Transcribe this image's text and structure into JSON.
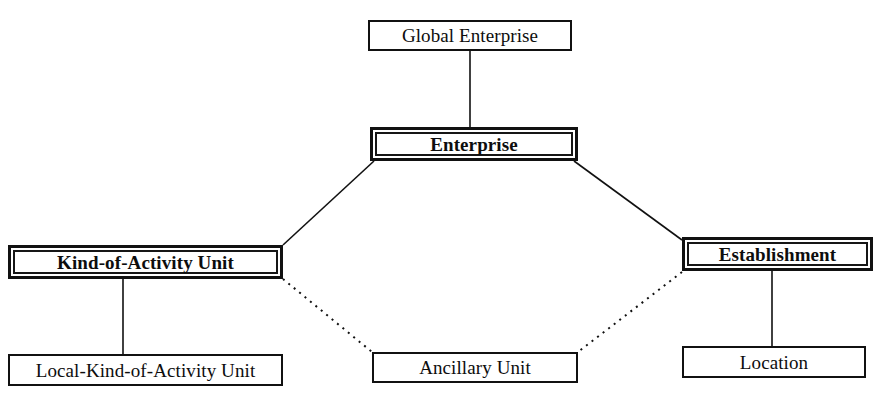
{
  "diagram": {
    "type": "hierarchy-tree",
    "canvas": {
      "width": 878,
      "height": 400,
      "background": "#ffffff"
    },
    "stroke_color": "#111111",
    "nodes": [
      {
        "id": "global-enterprise",
        "label": "Global Enterprise",
        "border": "single",
        "level": 0,
        "box": {
          "x": 368,
          "y": 20,
          "w": 204,
          "h": 31
        }
      },
      {
        "id": "enterprise",
        "label": "Enterprise",
        "border": "double",
        "level": 1,
        "box": {
          "x": 370,
          "y": 127,
          "w": 208,
          "h": 34
        }
      },
      {
        "id": "kind-of-activity-unit",
        "label": "Kind-of-Activity Unit",
        "border": "double",
        "level": 2,
        "box": {
          "x": 8,
          "y": 245,
          "w": 275,
          "h": 34
        }
      },
      {
        "id": "establishment",
        "label": "Establishment",
        "border": "double",
        "level": 2,
        "box": {
          "x": 682,
          "y": 237,
          "w": 191,
          "h": 34
        }
      },
      {
        "id": "local-kind-of-activity-unit",
        "label": "Local-Kind-of-Activity Unit",
        "border": "single",
        "level": 3,
        "box": {
          "x": 8,
          "y": 354,
          "w": 275,
          "h": 32
        }
      },
      {
        "id": "ancillary-unit",
        "label": "Ancillary Unit",
        "border": "single",
        "level": 3,
        "box": {
          "x": 372,
          "y": 352,
          "w": 206,
          "h": 31
        }
      },
      {
        "id": "location",
        "label": "Location",
        "border": "single",
        "level": 3,
        "box": {
          "x": 682,
          "y": 346,
          "w": 184,
          "h": 32
        }
      }
    ],
    "edges": [
      {
        "id": "edge-global-enterprise-to-enterprise",
        "from": "global-enterprise",
        "to": "enterprise",
        "style": "solid",
        "x1": 470,
        "y1": 51,
        "x2": 470,
        "y2": 127
      },
      {
        "id": "edge-enterprise-to-kind-of-activity-unit",
        "from": "enterprise",
        "to": "kind-of-activity-unit",
        "style": "solid",
        "x1": 374,
        "y1": 161,
        "x2": 283,
        "y2": 245
      },
      {
        "id": "edge-enterprise-to-establishment",
        "from": "enterprise",
        "to": "establishment",
        "style": "solid",
        "x1": 574,
        "y1": 161,
        "x2": 682,
        "y2": 240
      },
      {
        "id": "edge-kind-of-activity-unit-to-local-kind-of-activity-unit",
        "from": "kind-of-activity-unit",
        "to": "local-kind-of-activity-unit",
        "style": "solid",
        "x1": 123,
        "y1": 279,
        "x2": 123,
        "y2": 354
      },
      {
        "id": "edge-establishment-to-location",
        "from": "establishment",
        "to": "location",
        "style": "solid",
        "x1": 772,
        "y1": 271,
        "x2": 772,
        "y2": 346
      },
      {
        "id": "edge-kind-of-activity-unit-to-ancillary-unit",
        "from": "kind-of-activity-unit",
        "to": "ancillary-unit",
        "style": "dotted",
        "x1": 283,
        "y1": 279,
        "x2": 372,
        "y2": 352
      },
      {
        "id": "edge-establishment-to-ancillary-unit",
        "from": "establishment",
        "to": "ancillary-unit",
        "style": "dotted",
        "x1": 682,
        "y1": 272,
        "x2": 578,
        "y2": 352
      }
    ]
  }
}
